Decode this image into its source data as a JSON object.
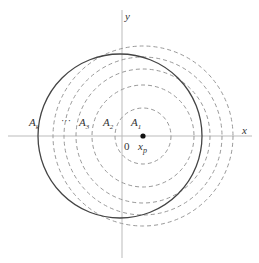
{
  "diagram": {
    "axes": {
      "x_label": "x",
      "y_label": "y",
      "origin_label": "0",
      "color": "#bbbbbb"
    },
    "point": {
      "label": "x",
      "subscript": "p",
      "color": "#111111"
    },
    "solid_circle": {
      "description": "reference circle",
      "color": "#444444"
    },
    "dashed_circles": {
      "count": 5,
      "color": "#999999",
      "description": "concentric circles centered at x_p"
    },
    "region_labels": [
      {
        "base": "A",
        "sub": "k"
      },
      {
        "base": "···",
        "sub": ""
      },
      {
        "base": "A",
        "sub": "3"
      },
      {
        "base": "A",
        "sub": "2"
      },
      {
        "base": "A",
        "sub": "1"
      }
    ]
  }
}
